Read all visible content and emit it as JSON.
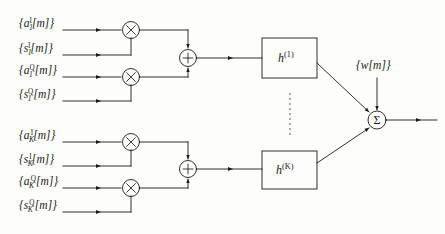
{
  "figure": {
    "type": "block-diagram",
    "background_color": "#fdfdfb",
    "line_color": "#1a1a1a",
    "width": 445,
    "height": 234
  },
  "inputs": {
    "branch_1": [
      {
        "id": "a1I",
        "text": "{a",
        "sub": "1",
        "sup": "I",
        "tail": "[m]}",
        "signal": "amplitude-inphase-user1"
      },
      {
        "id": "s1I",
        "text": "{s",
        "sub": "1",
        "sup": "I",
        "tail": "[m]}",
        "signal": "spreading-inphase-user1"
      },
      {
        "id": "a1Q",
        "text": "{a",
        "sub": "1",
        "sup": "Q",
        "tail": "[m]}",
        "signal": "amplitude-quadrature-user1"
      },
      {
        "id": "s1Q",
        "text": "{s",
        "sub": "1",
        "sup": "Q",
        "tail": "[m]}",
        "signal": "spreading-quadrature-user1"
      }
    ],
    "branch_K": [
      {
        "id": "aKI",
        "text": "{a",
        "sub": "K",
        "sup": "I",
        "tail": "[m]}",
        "signal": "amplitude-inphase-userK"
      },
      {
        "id": "sKI",
        "text": "{s",
        "sub": "K",
        "sup": "I",
        "tail": "[m]}",
        "signal": "spreading-inphase-userK"
      },
      {
        "id": "aKQ",
        "text": "{a",
        "sub": "K",
        "sup": "Q",
        "tail": "[m]}",
        "signal": "amplitude-quadrature-userK"
      },
      {
        "id": "sKQ",
        "text": "{s",
        "sub": "K",
        "sup": "Q",
        "tail": "[m]}",
        "signal": "spreading-quadrature-userK"
      }
    ]
  },
  "operators": {
    "multiplier_glyph": "×",
    "adder_glyph": "+",
    "summation_glyph": "Σ",
    "multiplier_name": "multiplier",
    "adder_name": "adder",
    "summation_name": "summing-junction"
  },
  "filters": [
    {
      "id": "h1",
      "base": "h",
      "sup": "(1)",
      "name": "channel-filter-1"
    },
    {
      "id": "hK",
      "base": "h",
      "sup": "(K)",
      "name": "channel-filter-K"
    }
  ],
  "noise": {
    "label": "{w[m]}",
    "name": "additive-noise-input"
  },
  "ellipsis": {
    "name": "vertical-ellipsis",
    "dot_count": 9
  },
  "output": {
    "name": "received-signal-output",
    "label": ""
  }
}
